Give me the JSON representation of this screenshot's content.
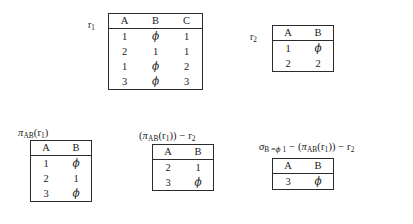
{
  "diagram": {
    "null_symbol": "ϕ"
  },
  "relations": [
    {
      "id": "r1",
      "label_plain": "r",
      "label_sub": "1",
      "label_position": "left",
      "columns": [
        "A",
        "B",
        "C"
      ],
      "rows": [
        [
          "1",
          "ϕ",
          "1"
        ],
        [
          "2",
          "1",
          "1"
        ],
        [
          "1",
          "ϕ",
          "2"
        ],
        [
          "3",
          "ϕ",
          "3"
        ]
      ]
    },
    {
      "id": "r2",
      "label_plain": "r",
      "label_sub": "2",
      "label_position": "left",
      "columns": [
        "A",
        "B"
      ],
      "rows": [
        [
          "1",
          "ϕ"
        ],
        [
          "2",
          "2"
        ]
      ]
    },
    {
      "id": "proj_ab_r1",
      "caption_parts": [
        {
          "text": "π",
          "style": "symbol"
        },
        {
          "text": "AB",
          "style": "subscript"
        },
        {
          "text": "(",
          "style": "plain"
        },
        {
          "text": "r",
          "style": "plain"
        },
        {
          "text": "1",
          "style": "subscript"
        },
        {
          "text": ")",
          "style": "plain"
        }
      ],
      "caption_text": "πAB(r1)",
      "label_position": "above",
      "columns": [
        "A",
        "B"
      ],
      "rows": [
        [
          "1",
          "ϕ"
        ],
        [
          "2",
          "1"
        ],
        [
          "3",
          "ϕ"
        ]
      ]
    },
    {
      "id": "proj_minus_r2",
      "caption_parts": [
        {
          "text": "(",
          "style": "plain"
        },
        {
          "text": "π",
          "style": "symbol"
        },
        {
          "text": "AB",
          "style": "subscript"
        },
        {
          "text": "(",
          "style": "plain"
        },
        {
          "text": "r",
          "style": "plain"
        },
        {
          "text": "1",
          "style": "subscript"
        },
        {
          "text": ")) − ",
          "style": "plain"
        },
        {
          "text": "r",
          "style": "plain"
        },
        {
          "text": "2",
          "style": "subscript"
        }
      ],
      "caption_text": "(πAB(r1)) − r2",
      "label_position": "above",
      "columns": [
        "A",
        "B"
      ],
      "rows": [
        [
          "2",
          "1"
        ],
        [
          "3",
          "ϕ"
        ]
      ]
    },
    {
      "id": "select_b_eq_phi",
      "caption_parts": [
        {
          "text": "σ",
          "style": "symbol"
        },
        {
          "text": "B =ϕ 1",
          "style": "subscript"
        },
        {
          "text": " − (",
          "style": "plain"
        },
        {
          "text": "π",
          "style": "symbol"
        },
        {
          "text": "AB",
          "style": "subscript"
        },
        {
          "text": "(",
          "style": "plain"
        },
        {
          "text": "r",
          "style": "plain"
        },
        {
          "text": "1",
          "style": "subscript"
        },
        {
          "text": ")) − ",
          "style": "plain"
        },
        {
          "text": "r",
          "style": "plain"
        },
        {
          "text": "2",
          "style": "subscript"
        }
      ],
      "caption_text": "σB =ϕ 1 − (πAB(r1)) − r2",
      "label_position": "above",
      "columns": [
        "A",
        "B"
      ],
      "rows": [
        [
          "3",
          "ϕ"
        ]
      ]
    }
  ],
  "colors": {
    "text": "#1a1a1a",
    "border": "#2b2b2b",
    "background": "#ffffff"
  }
}
